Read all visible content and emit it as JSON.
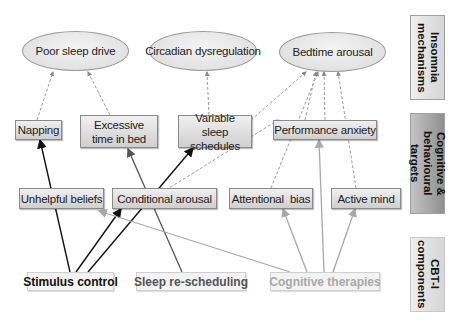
{
  "side_labels": {
    "mechanisms": "Insomnia mechanisms",
    "targets": "Cognitive & behavioural targets",
    "components": "CBT-I components"
  },
  "mechanisms": {
    "poor_sleep_drive": "Poor sleep drive",
    "circadian": "Circadian dysregulation",
    "bedtime_arousal": "Bedtime arousal"
  },
  "targets": {
    "napping": "Napping",
    "excessive_time": "Excessive time in bed",
    "variable_sleep": "Variable sleep schedules",
    "performance_anxiety": "Performance anxiety",
    "unhelpful_beliefs": "Unhelpful beliefs",
    "conditional_arousal": "Conditional arousal",
    "attentional_bias": "Attentional  bias",
    "active_mind": "Active mind"
  },
  "components": {
    "stimulus_control": "Stimulus control",
    "sleep_rescheduling": "Sleep re-scheduling",
    "cognitive_therapies": "Cognitive therapies"
  },
  "colors": {
    "stimulus_control": "#111111",
    "sleep_rescheduling": "#555555",
    "cognitive_therapies": "#a8a8a8",
    "dashed": "#9a9a9a"
  }
}
